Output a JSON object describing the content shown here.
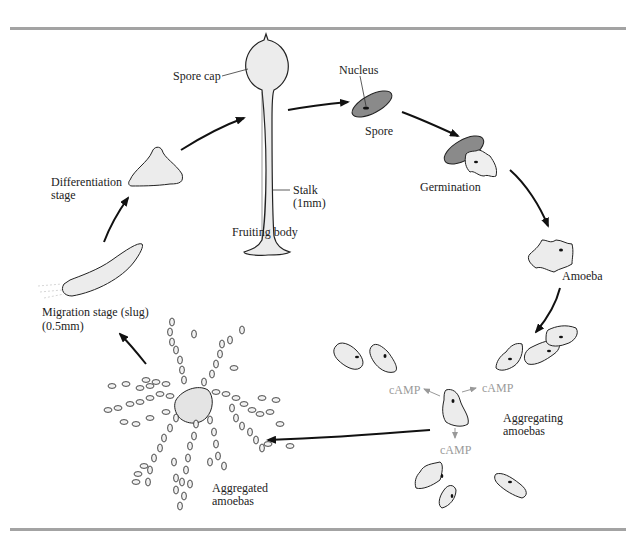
{
  "figure": {
    "labels": {
      "spore_cap": "Spore cap",
      "nucleus": "Nucleus",
      "spore": "Spore",
      "stalk": "Stalk",
      "stalk_size": "(1mm)",
      "fruiting_body": "Fruiting body",
      "germination": "Germination",
      "amoeba": "Amoeba",
      "differentiation_1": "Differentiation",
      "differentiation_2": "stage",
      "migration_1": "Migration stage (slug)",
      "migration_2": "(0.5mm)",
      "camp_left": "cAMP",
      "camp_right": "cAMP",
      "camp_bottom": "cAMP",
      "aggregating_1": "Aggregating",
      "aggregating_2": "amoebas",
      "aggregated_1": "Aggregated",
      "aggregated_2": "amoebas"
    },
    "stages": [
      "Spore",
      "Germination",
      "Amoeba",
      "Aggregating amoebas",
      "Aggregated amoebas",
      "Migration stage (slug)",
      "Differentiation stage",
      "Fruiting body"
    ],
    "colors": {
      "rule": "#a3a3a3",
      "cell_fill": "#ebebeb",
      "spore_fill": "#8a8a8a",
      "camp_text": "#9a9a9a",
      "arrow": "#111111"
    }
  }
}
